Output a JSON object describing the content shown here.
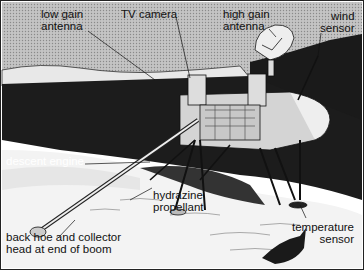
{
  "diagram": {
    "labels": {
      "low_gain_antenna": [
        "low gain",
        "antenna"
      ],
      "tv_camera": [
        "TV camera"
      ],
      "high_gain_antenna": [
        "high gain",
        "antenna"
      ],
      "wind_sensor": [
        "wind",
        "sensor"
      ],
      "descent_engine": [
        "descent engine"
      ],
      "hydrazine_propellant": [
        "hydrazine",
        "propellant"
      ],
      "back_hoe": [
        "back hoe and collector",
        "head at end of boom"
      ],
      "temperature_sensor": [
        "temperature",
        "sensor"
      ]
    },
    "colors": {
      "sky": "#b8b8b8",
      "ground_dark": "#1a1a1a",
      "ground_light": "#f2f2f2",
      "lander": "#cfcfcf",
      "ink": "#111111"
    }
  }
}
